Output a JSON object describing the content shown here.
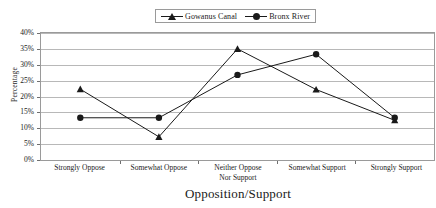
{
  "chart_data": {
    "type": "line",
    "title": "",
    "xlabel": "Opposition/Support",
    "ylabel": "Percentage",
    "categories": [
      "Strongly Oppose",
      "Somewhat Oppose",
      "Neither Oppose Nor Support",
      "Somewhat Support",
      "Strongly Support"
    ],
    "category_lines": [
      [
        "Strongly Oppose"
      ],
      [
        "Somewhat Oppose"
      ],
      [
        "Neither Oppose",
        "Nor Support"
      ],
      [
        "Somewhat Support"
      ],
      [
        "Strongly Support"
      ]
    ],
    "series": [
      {
        "name": "Gowanus Canal",
        "marker": "triangle",
        "color": "#1a1a1a",
        "values": [
          22.3,
          7.3,
          35.0,
          22.2,
          12.5
        ]
      },
      {
        "name": "Bronx River",
        "marker": "circle",
        "color": "#1a1a1a",
        "values": [
          13.3,
          13.3,
          26.8,
          33.3,
          13.3
        ]
      }
    ],
    "ylim": [
      0,
      40
    ],
    "ytick_step": 5,
    "ytick_labels": [
      "40%",
      "35%",
      "30%",
      "25%",
      "20%",
      "15%",
      "10%",
      "5%",
      "0%"
    ],
    "ytick_values": [
      40,
      35,
      30,
      25,
      20,
      15,
      10,
      5,
      0
    ],
    "grid": true,
    "grid_axis": "y",
    "legend_position": "top-center",
    "plot_border": true
  },
  "legend": {
    "entries": [
      {
        "label": "Gowanus Canal",
        "marker": "triangle"
      },
      {
        "label": "Bronx River",
        "marker": "circle"
      }
    ]
  },
  "colors": {
    "ink": "#1a1a1a",
    "gridline": "#b8b8b8",
    "axis": "#808080",
    "background": "#ffffff"
  }
}
